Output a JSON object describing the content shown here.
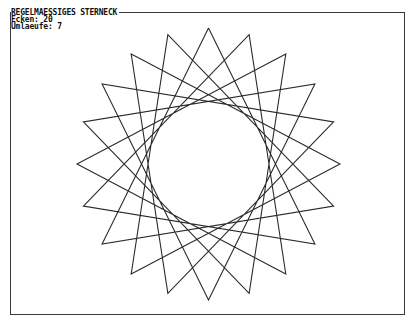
{
  "header": {
    "title": "REGELMAESSIGES STERNECK",
    "ecken_label": "Ecken:",
    "ecken_value": "20",
    "umlaeufe_label": "Umlaeufe:",
    "umlaeufe_value": "7"
  },
  "star": {
    "points": 20,
    "step": 7,
    "center_x": 208.5,
    "center_y": 164,
    "radius_x": 131.5,
    "radius_y": 136,
    "start_angle_deg": -90,
    "stroke_color": "#2a2a2a"
  },
  "colors": {
    "background": "#ffffff",
    "text": "#111111",
    "frame": "#3a3a3a"
  }
}
